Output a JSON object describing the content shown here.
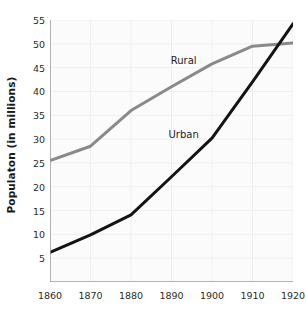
{
  "chart_data": {
    "type": "line",
    "title": "",
    "xlabel": "",
    "ylabel": "Populaton (in millions)",
    "x": [
      1860,
      1870,
      1880,
      1890,
      1900,
      1910,
      1920
    ],
    "xlim": [
      1860,
      1920
    ],
    "ylim": [
      0,
      55
    ],
    "xticks": [
      "1860",
      "1870",
      "1880",
      "1890",
      "1900",
      "1910",
      "1920"
    ],
    "yticks": [
      "5",
      "10",
      "15",
      "20",
      "25",
      "30",
      "35",
      "40",
      "45",
      "50",
      "55"
    ],
    "grid": true,
    "legend_position": "inline-annotation",
    "series": [
      {
        "name": "Rural",
        "color": "#8a8a8a",
        "values": [
          25.5,
          28.5,
          36.0,
          41.0,
          45.8,
          49.5,
          50.2
        ],
        "label_x": 1893,
        "label_y": 46.5
      },
      {
        "name": "Urban",
        "color": "#141414",
        "values": [
          6.2,
          9.9,
          14.1,
          22.1,
          30.2,
          42.0,
          54.2
        ],
        "label_x": 1893,
        "label_y": 31.0
      }
    ],
    "annotations": [
      {
        "text": "Rural",
        "series": "Rural"
      },
      {
        "text": "Urban",
        "series": "Urban"
      }
    ]
  },
  "axis": {
    "spine_color": "#9a9a9a",
    "grid_color": "#efefef",
    "plot_background": "#fbfbfb"
  }
}
